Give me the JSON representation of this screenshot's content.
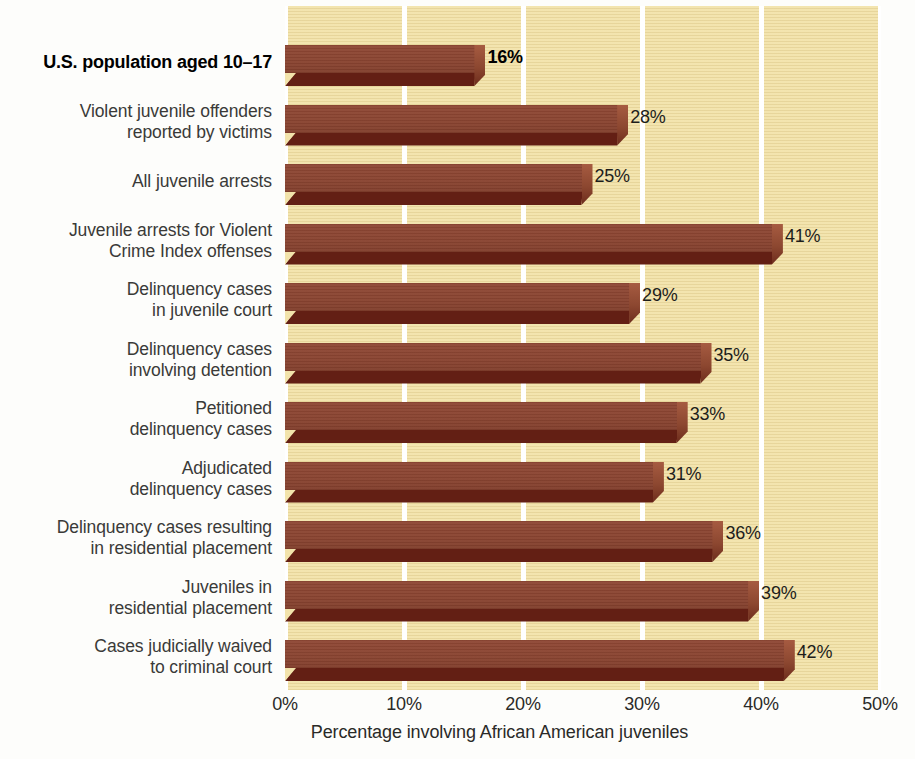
{
  "chart_data": {
    "type": "bar",
    "orientation": "horizontal",
    "title": "",
    "xlabel": "Percentage involving African American juveniles",
    "ylabel": "",
    "xlim": [
      0,
      50
    ],
    "xticks": [
      "0%",
      "10%",
      "20%",
      "30%",
      "40%",
      "50%"
    ],
    "xtick_values": [
      0,
      10,
      20,
      30,
      40,
      50
    ],
    "grid": "vertical-white-gridlines",
    "legend": "none",
    "categories": [
      "U.S. population aged 10–17",
      "Violent juvenile offenders reported by victims",
      "All juvenile arrests",
      "Juvenile arrests for Violent Crime Index offenses",
      "Delinquency cases in juvenile court",
      "Delinquency cases involving detention",
      "Petitioned delinquency cases",
      "Adjudicated delinquency cases",
      "Delinquency cases resulting in residential placement",
      "Juveniles in residential placement",
      "Cases judicially waived to criminal court"
    ],
    "values": [
      16,
      28,
      25,
      41,
      29,
      35,
      33,
      31,
      36,
      39,
      42
    ],
    "value_labels": [
      "16%",
      "28%",
      "25%",
      "41%",
      "29%",
      "35%",
      "33%",
      "31%",
      "36%",
      "39%",
      "42%"
    ],
    "bars": [
      {
        "label_lines": [
          "U.S. population aged 10–17"
        ],
        "value": 16,
        "value_label": "16%",
        "emphasis": true
      },
      {
        "label_lines": [
          "Violent juvenile offenders",
          "reported by victims"
        ],
        "value": 28,
        "value_label": "28%",
        "emphasis": false
      },
      {
        "label_lines": [
          "All juvenile arrests"
        ],
        "value": 25,
        "value_label": "25%",
        "emphasis": false
      },
      {
        "label_lines": [
          "Juvenile arrests for Violent",
          "Crime Index offenses"
        ],
        "value": 41,
        "value_label": "41%",
        "emphasis": false
      },
      {
        "label_lines": [
          "Delinquency cases",
          "in juvenile court"
        ],
        "value": 29,
        "value_label": "29%",
        "emphasis": false
      },
      {
        "label_lines": [
          "Delinquency cases",
          "involving detention"
        ],
        "value": 35,
        "value_label": "35%",
        "emphasis": false
      },
      {
        "label_lines": [
          "Petitioned",
          "delinquency cases"
        ],
        "value": 33,
        "value_label": "33%",
        "emphasis": false
      },
      {
        "label_lines": [
          "Adjudicated",
          "delinquency cases"
        ],
        "value": 31,
        "value_label": "31%",
        "emphasis": false
      },
      {
        "label_lines": [
          "Delinquency cases resulting",
          "in residential placement"
        ],
        "value": 36,
        "value_label": "36%",
        "emphasis": false
      },
      {
        "label_lines": [
          "Juveniles in",
          "residential placement"
        ],
        "value": 39,
        "value_label": "39%",
        "emphasis": false
      },
      {
        "label_lines": [
          "Cases judicially waived",
          "to criminal court"
        ],
        "value": 42,
        "value_label": "42%",
        "emphasis": false
      }
    ]
  },
  "colors": {
    "plot_background": "#f2e3ab",
    "bar_top_face": "#8a4431",
    "bar_bottom_face": "#631f14",
    "bar_end_cap": "#a65b41",
    "gridline": "#ffffff",
    "page_background": "#fdfdfb",
    "label_text": "#3a3a38",
    "emphasis_text": "#000000"
  }
}
